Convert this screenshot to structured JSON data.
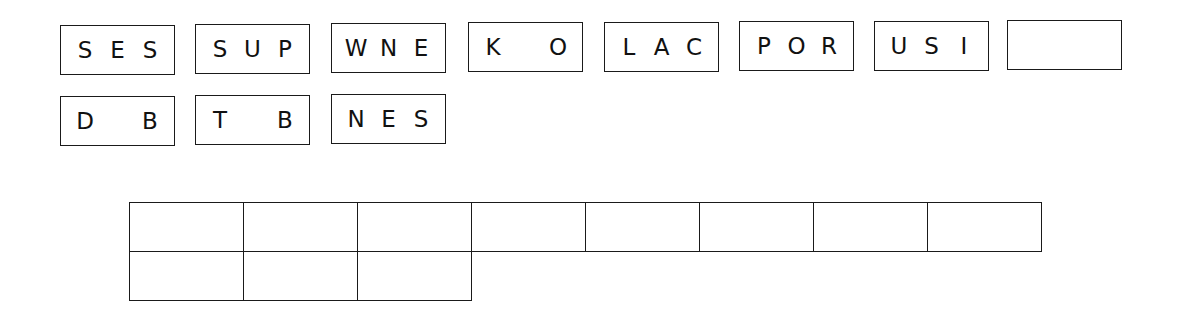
{
  "tiles_row1": [
    {
      "slots": [
        "S",
        "E",
        "S"
      ]
    },
    {
      "slots": [
        "S",
        "U",
        "P"
      ]
    },
    {
      "slots": [
        "W",
        "N",
        "E"
      ]
    },
    {
      "slots": [
        "K",
        "",
        "O"
      ]
    },
    {
      "slots": [
        "L",
        "A",
        "C"
      ]
    },
    {
      "slots": [
        "P",
        "O",
        "R"
      ]
    },
    {
      "slots": [
        "U",
        "S",
        "I"
      ]
    },
    {
      "slots": [
        "",
        "",
        ""
      ]
    }
  ],
  "tiles_row2": [
    {
      "slots": [
        "D",
        "",
        "B"
      ]
    },
    {
      "slots": [
        "T",
        "",
        "B"
      ]
    },
    {
      "slots": [
        "N",
        "E",
        "S"
      ]
    }
  ],
  "answer_grid": {
    "rows": [
      [
        "",
        "",
        "",
        "",
        "",
        "",
        "",
        ""
      ],
      [
        "",
        "",
        ""
      ]
    ]
  }
}
